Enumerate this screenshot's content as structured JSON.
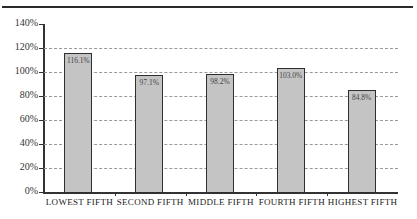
{
  "chart_data": {
    "type": "bar",
    "title": "",
    "xlabel": "",
    "ylabel": "",
    "categories": [
      "LOWEST FIFTH",
      "SECOND FIFTH",
      "MIDDLE FIFTH",
      "FOURTH FIFTH",
      "HIGHEST FIFTH"
    ],
    "values": [
      116.1,
      97.1,
      98.2,
      103.0,
      84.8
    ],
    "value_labels": [
      "116.1%",
      "97.1%",
      "98.2%",
      "103.0%",
      "84.8%"
    ],
    "ylim": [
      0,
      140
    ],
    "y_ticks": [
      "0%",
      "20%",
      "40%",
      "60%",
      "80%",
      "100%",
      "120%",
      "140%"
    ],
    "grid": true,
    "legend": null,
    "bar_color": "#c4c4c4",
    "bar_edge_color": "#2f2f2f"
  }
}
